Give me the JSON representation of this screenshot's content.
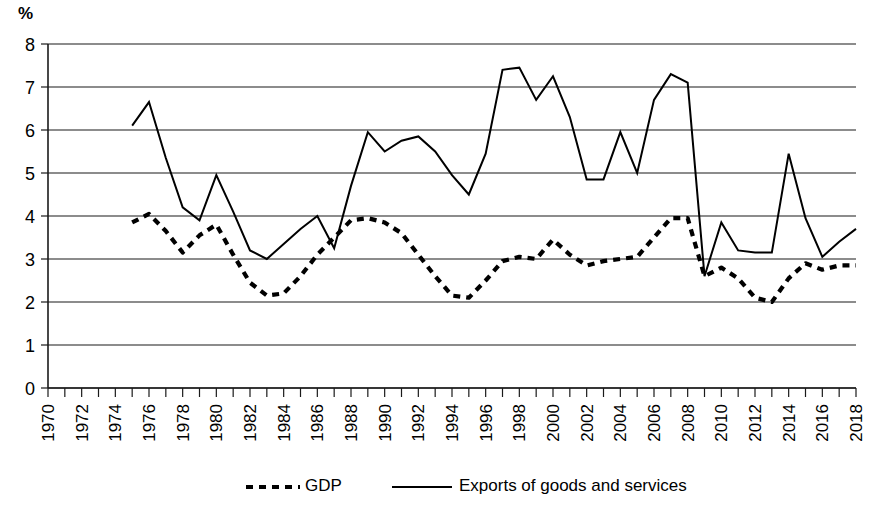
{
  "axis": {
    "unit_label": "%",
    "y_ticks": [
      "0",
      "1",
      "2",
      "3",
      "4",
      "5",
      "6",
      "7",
      "8"
    ],
    "x_ticks": [
      "1970",
      "1972",
      "1974",
      "1976",
      "1978",
      "1980",
      "1982",
      "1984",
      "1986",
      "1988",
      "1990",
      "1992",
      "1994",
      "1996",
      "1998",
      "2000",
      "2002",
      "2004",
      "2006",
      "2008",
      "2010",
      "2012",
      "2014",
      "2016",
      "2018"
    ]
  },
  "legend": {
    "gdp_label": "GDP",
    "exports_label": "Exports of goods and services"
  },
  "chart_data": {
    "type": "line",
    "title": "",
    "xlabel": "",
    "ylabel": "%",
    "ylim": [
      0,
      8
    ],
    "xlim": [
      1970,
      2018
    ],
    "grid": true,
    "legend_position": "bottom",
    "x": [
      1970,
      1971,
      1972,
      1973,
      1974,
      1975,
      1976,
      1977,
      1978,
      1979,
      1980,
      1981,
      1982,
      1983,
      1984,
      1985,
      1986,
      1987,
      1988,
      1989,
      1990,
      1991,
      1992,
      1993,
      1994,
      1995,
      1996,
      1997,
      1998,
      1999,
      2000,
      2001,
      2002,
      2003,
      2004,
      2005,
      2006,
      2007,
      2008,
      2009,
      2010,
      2011,
      2012,
      2013,
      2014,
      2015,
      2016,
      2017,
      2018
    ],
    "series": [
      {
        "name": "GDP",
        "style": "dashed",
        "color": "#000000",
        "values": [
          null,
          null,
          null,
          null,
          null,
          3.85,
          4.05,
          3.65,
          3.15,
          3.55,
          3.8,
          3.1,
          2.45,
          2.15,
          2.2,
          2.6,
          3.1,
          3.5,
          3.9,
          3.95,
          3.85,
          3.6,
          3.1,
          2.6,
          2.15,
          2.1,
          2.5,
          2.95,
          3.05,
          3.0,
          3.45,
          3.1,
          2.85,
          2.95,
          3.0,
          3.05,
          3.5,
          3.95,
          3.95,
          2.6,
          2.8,
          2.55,
          2.1,
          2.0,
          2.55,
          2.9,
          2.75,
          2.85,
          2.85
        ]
      },
      {
        "name": "Exports of goods and services",
        "style": "solid",
        "color": "#000000",
        "values": [
          null,
          null,
          null,
          null,
          null,
          6.1,
          6.65,
          5.35,
          4.2,
          3.9,
          4.95,
          4.1,
          3.2,
          3.0,
          3.35,
          3.7,
          4.0,
          3.25,
          4.7,
          5.95,
          5.5,
          5.75,
          5.85,
          5.5,
          4.95,
          4.5,
          5.45,
          7.4,
          7.45,
          6.7,
          7.25,
          6.3,
          4.85,
          4.85,
          5.95,
          5.0,
          6.7,
          7.3,
          7.1,
          2.6,
          3.85,
          3.2,
          3.15,
          3.15,
          5.45,
          3.95,
          3.05,
          3.4,
          3.7
        ]
      }
    ]
  }
}
